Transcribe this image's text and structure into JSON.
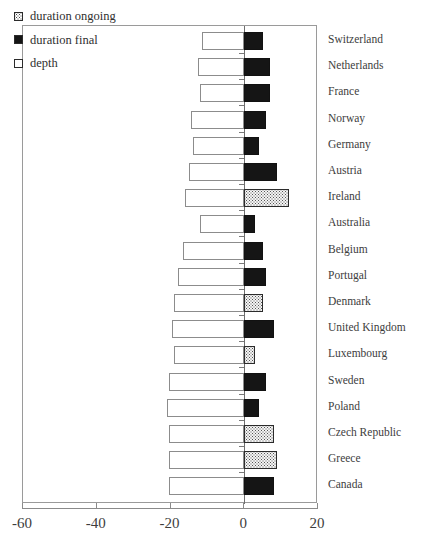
{
  "chart_data": {
    "type": "bar",
    "orientation": "horizontal",
    "title": "",
    "xlabel": "",
    "ylabel": "",
    "xlim": [
      -60,
      20
    ],
    "xticks": [
      -60,
      -40,
      -20,
      0,
      20
    ],
    "xtick_labels": [
      "-60",
      "-40",
      "-20",
      "0",
      "20"
    ],
    "grid": false,
    "legend_position": "top-left",
    "legend": [
      {
        "key": "duration_ongoing",
        "label": "duration ongoing",
        "style": "dotted",
        "color": "#f4f4f4"
      },
      {
        "key": "duration_final",
        "label": "duration final",
        "style": "solid",
        "color": "#151515"
      },
      {
        "key": "depth",
        "label": "depth",
        "style": "empty",
        "color": "#ffffff"
      }
    ],
    "categories": [
      "Switzerland",
      "Netherlands",
      "France",
      "Norway",
      "Germany",
      "Austria",
      "Ireland",
      "Australia",
      "Belgium",
      "Portugal",
      "Denmark",
      "United Kingdom",
      "Luxembourg",
      "Sweden",
      "Poland",
      "Czech Republic",
      "Greece",
      "Canada"
    ],
    "series": [
      {
        "name": "depth",
        "note": "negative values extending left from zero",
        "values": [
          -11.5,
          -12.5,
          -12,
          -14.5,
          -14,
          -15,
          -16,
          -12,
          -16.5,
          -18,
          -19,
          -19.5,
          -19,
          -20.5,
          -21,
          -20.5,
          -20.5,
          -20.5
        ]
      },
      {
        "name": "duration final",
        "note": "positive values extending right from zero; null where duration is ongoing",
        "values": [
          5,
          7,
          7,
          6,
          4,
          9,
          null,
          3,
          5,
          6,
          null,
          8,
          null,
          6,
          4,
          null,
          null,
          8
        ]
      },
      {
        "name": "duration ongoing",
        "note": "positive values extending right from zero; null where duration is final",
        "values": [
          null,
          null,
          null,
          null,
          null,
          null,
          12,
          null,
          null,
          null,
          5,
          null,
          3,
          null,
          null,
          8,
          9,
          null
        ]
      }
    ],
    "rows": [
      {
        "category": "Switzerland",
        "depth": -11.5,
        "duration_final": 5,
        "duration_ongoing": null
      },
      {
        "category": "Netherlands",
        "depth": -12.5,
        "duration_final": 7,
        "duration_ongoing": null
      },
      {
        "category": "France",
        "depth": -12.0,
        "duration_final": 7,
        "duration_ongoing": null
      },
      {
        "category": "Norway",
        "depth": -14.5,
        "duration_final": 6,
        "duration_ongoing": null
      },
      {
        "category": "Germany",
        "depth": -14.0,
        "duration_final": 4,
        "duration_ongoing": null
      },
      {
        "category": "Austria",
        "depth": -15.0,
        "duration_final": 9,
        "duration_ongoing": null
      },
      {
        "category": "Ireland",
        "depth": -16.0,
        "duration_final": null,
        "duration_ongoing": 12
      },
      {
        "category": "Australia",
        "depth": -12.0,
        "duration_final": 3,
        "duration_ongoing": null
      },
      {
        "category": "Belgium",
        "depth": -16.5,
        "duration_final": 5,
        "duration_ongoing": null
      },
      {
        "category": "Portugal",
        "depth": -18.0,
        "duration_final": 6,
        "duration_ongoing": null
      },
      {
        "category": "Denmark",
        "depth": -19.0,
        "duration_final": null,
        "duration_ongoing": 5
      },
      {
        "category": "United Kingdom",
        "depth": -19.5,
        "duration_final": 8,
        "duration_ongoing": null
      },
      {
        "category": "Luxembourg",
        "depth": -19.0,
        "duration_final": null,
        "duration_ongoing": 3
      },
      {
        "category": "Sweden",
        "depth": -20.5,
        "duration_final": 6,
        "duration_ongoing": null
      },
      {
        "category": "Poland",
        "depth": -21.0,
        "duration_final": 4,
        "duration_ongoing": null
      },
      {
        "category": "Czech Republic",
        "depth": -20.5,
        "duration_final": null,
        "duration_ongoing": 8
      },
      {
        "category": "Greece",
        "depth": -20.5,
        "duration_final": null,
        "duration_ongoing": 9
      },
      {
        "category": "Canada",
        "depth": -20.5,
        "duration_final": 8,
        "duration_ongoing": null
      }
    ]
  }
}
